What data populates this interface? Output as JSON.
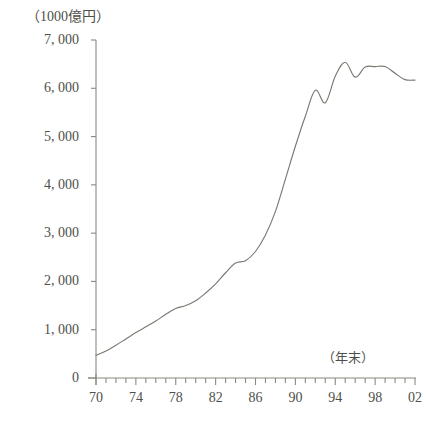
{
  "chart_data": {
    "type": "line",
    "title": "",
    "unit_label": "（1000億円）",
    "xlabel": "（年末）",
    "ylabel": "",
    "grid": false,
    "legend": null,
    "ylim": [
      0,
      7000
    ],
    "ytick_labels": [
      "7, 000",
      "6, 000",
      "5, 000",
      "4, 000",
      "3, 000",
      "2, 000",
      "1, 000",
      "0"
    ],
    "ytick_values": [
      7000,
      6000,
      5000,
      4000,
      3000,
      2000,
      1000,
      0
    ],
    "xlim": [
      70,
      102
    ],
    "xtick_labels": [
      "70",
      "74",
      "78",
      "82",
      "86",
      "90",
      "94",
      "98",
      "02"
    ],
    "xtick_values": [
      70,
      74,
      78,
      82,
      86,
      90,
      94,
      98,
      102
    ],
    "x_minor_tick_step": 1,
    "x": [
      70,
      71,
      72,
      73,
      74,
      75,
      76,
      77,
      78,
      79,
      80,
      81,
      82,
      83,
      84,
      85,
      86,
      87,
      88,
      89,
      90,
      91,
      92,
      93,
      94,
      95,
      96,
      97,
      98,
      99,
      100,
      101,
      102
    ],
    "values": [
      470,
      560,
      680,
      810,
      940,
      1060,
      1180,
      1320,
      1440,
      1500,
      1600,
      1760,
      1950,
      2180,
      2380,
      2430,
      2620,
      2960,
      3450,
      4120,
      4800,
      5420,
      5960,
      5700,
      6250,
      6540,
      6230,
      6440,
      6450,
      6450,
      6310,
      6180,
      6170
    ],
    "series": [
      {
        "name": "",
        "color": "#7a7a72",
        "values": [
          470,
          560,
          680,
          810,
          940,
          1060,
          1180,
          1320,
          1440,
          1500,
          1600,
          1760,
          1950,
          2180,
          2380,
          2430,
          2620,
          2960,
          3450,
          4120,
          4800,
          5420,
          5960,
          5700,
          6250,
          6540,
          6230,
          6440,
          6450,
          6450,
          6310,
          6180,
          6170
        ]
      }
    ],
    "axis_color": "#8a8a80",
    "line_color": "#7a7a72"
  }
}
